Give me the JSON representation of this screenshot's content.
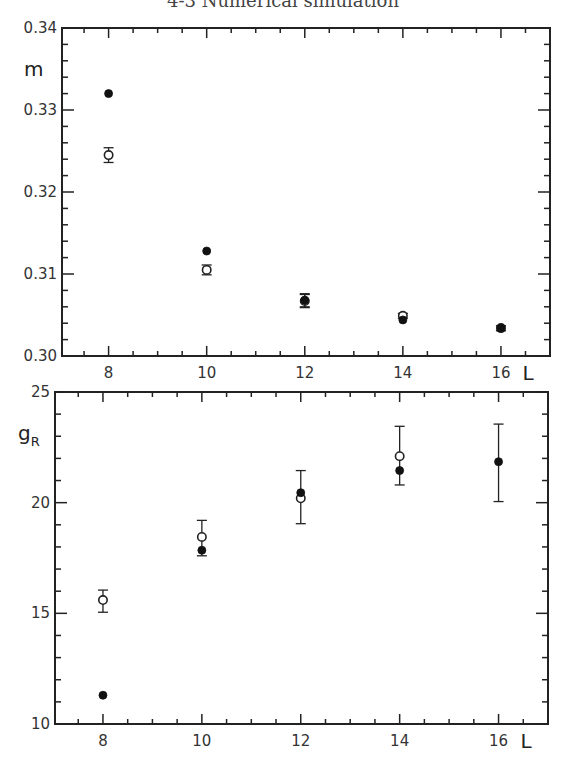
{
  "page": {
    "title": "4-3 Numerical simulation"
  },
  "chart_data": [
    {
      "type": "scatter",
      "title": "",
      "xlabel": "L",
      "ylabel": "m",
      "xlim": [
        7.05,
        17.0
      ],
      "ylim": [
        0.3,
        0.34
      ],
      "xticks": [
        8,
        10,
        12,
        14,
        16
      ],
      "xtick_labels": [
        "8",
        "10",
        "12",
        "14",
        "16"
      ],
      "xminor_step": 0.5,
      "yticks": [
        0.3,
        0.31,
        0.32,
        0.33,
        0.34
      ],
      "ytick_labels": [
        "0.30",
        "0.31",
        "0.32",
        "0.33",
        "0.34"
      ],
      "yminor_step": 0.002,
      "grid": false,
      "series": [
        {
          "name": "open circles",
          "marker": "open-circle",
          "points": [
            {
              "x": 8,
              "y": 0.3245,
              "err": 0.0009
            },
            {
              "x": 10,
              "y": 0.3105,
              "err": 0.0006
            },
            {
              "x": 12,
              "y": 0.3067,
              "err": 0.0008
            },
            {
              "x": 14,
              "y": 0.3049,
              "err": 0.0003
            },
            {
              "x": 16,
              "y": 0.3034,
              "err": 0.0003
            }
          ]
        },
        {
          "name": "filled circles",
          "marker": "filled-circle",
          "points": [
            {
              "x": 8,
              "y": 0.332,
              "err": 0
            },
            {
              "x": 10,
              "y": 0.3128,
              "err": 0
            },
            {
              "x": 12,
              "y": 0.3068,
              "err": 0.0008
            },
            {
              "x": 14,
              "y": 0.3044,
              "err": 0
            },
            {
              "x": 16,
              "y": 0.3034,
              "err": 0.0003
            }
          ]
        }
      ]
    },
    {
      "type": "scatter",
      "title": "",
      "xlabel": "L",
      "ylabel": "g",
      "ylabel_subscript": "R",
      "xlim": [
        7.03,
        17.0
      ],
      "ylim": [
        10,
        25
      ],
      "xticks": [
        8,
        10,
        12,
        14,
        16
      ],
      "xtick_labels": [
        "8",
        "10",
        "12",
        "14",
        "16"
      ],
      "xminor_step": 0.5,
      "yticks": [
        10,
        15,
        20,
        25
      ],
      "ytick_labels": [
        "10",
        "15",
        "20",
        "25"
      ],
      "yminor_step": 1,
      "grid": false,
      "series": [
        {
          "name": "open circles",
          "marker": "open-circle",
          "points": [
            {
              "x": 8,
              "y": 15.6,
              "err_low": 15.05,
              "err_high": 16.05
            },
            {
              "x": 10,
              "y": 18.45,
              "err_low": 17.6,
              "err_high": 19.2
            },
            {
              "x": 12,
              "y": 20.2,
              "err_low": 19.05,
              "err_high": 21.45
            },
            {
              "x": 14,
              "y": 22.1,
              "err_low": 20.8,
              "err_high": 23.45
            }
          ]
        },
        {
          "name": "filled circles",
          "marker": "filled-circle",
          "points": [
            {
              "x": 8,
              "y": 11.3
            },
            {
              "x": 10,
              "y": 17.85
            },
            {
              "x": 12,
              "y": 20.45
            },
            {
              "x": 14,
              "y": 21.45
            },
            {
              "x": 16,
              "y": 21.85,
              "err_low": 20.05,
              "err_high": 23.55
            }
          ]
        }
      ]
    }
  ]
}
